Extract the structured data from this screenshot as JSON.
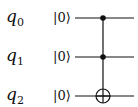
{
  "circuit": {
    "gate": "Toffoli",
    "qubits": [
      {
        "name": "q",
        "index": "0",
        "init": "|0⟩",
        "role": "control"
      },
      {
        "name": "q",
        "index": "1",
        "init": "|0⟩",
        "role": "control"
      },
      {
        "name": "q",
        "index": "2",
        "init": "|0⟩",
        "role": "target"
      }
    ],
    "colors": {
      "line": "#111111"
    }
  }
}
